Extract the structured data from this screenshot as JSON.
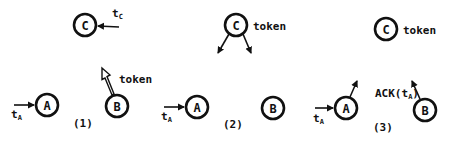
{
  "diagram": {
    "type": "token-passing protocol steps",
    "panels": [
      {
        "id": "1",
        "caption": "(1)",
        "nodes": [
          {
            "id": "C",
            "label": "C",
            "input_label": "t",
            "input_sub": "C"
          },
          {
            "id": "A",
            "label": "A",
            "input_label": "t",
            "input_sub": "A"
          },
          {
            "id": "B",
            "label": "B",
            "output_label": "token"
          }
        ]
      },
      {
        "id": "2",
        "caption": "(2)",
        "nodes": [
          {
            "id": "C",
            "label": "C",
            "holds": "token"
          },
          {
            "id": "A",
            "label": "A",
            "input_label": "t",
            "input_sub": "A"
          },
          {
            "id": "B",
            "label": "B"
          }
        ]
      },
      {
        "id": "3",
        "caption": "(3)",
        "nodes": [
          {
            "id": "C",
            "label": "C",
            "holds": "token"
          },
          {
            "id": "A",
            "label": "A",
            "input_label": "t",
            "input_sub": "A"
          },
          {
            "id": "B",
            "label": "B",
            "output_label": "ACK(t",
            "output_sub": "A",
            "output_close": ")"
          }
        ]
      }
    ]
  }
}
